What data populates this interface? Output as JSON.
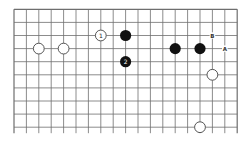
{
  "diagram": {
    "type": "go-board-fragment",
    "columns": 19,
    "rows": 10,
    "open_bottom": true,
    "colors": {
      "background": "#ffffff",
      "grid": "#6e6e6e",
      "black_stone": "#111111",
      "white_stone_fill": "#ffffff",
      "white_stone_stroke": "#555555",
      "label": "#333333"
    },
    "stones": [
      {
        "color": "white",
        "col": 2,
        "row": 3,
        "label": ""
      },
      {
        "color": "white",
        "col": 4,
        "row": 3,
        "label": ""
      },
      {
        "color": "white",
        "col": 7,
        "row": 2,
        "label": "1"
      },
      {
        "color": "black",
        "col": 9,
        "row": 2,
        "label": ""
      },
      {
        "color": "black",
        "col": 9,
        "row": 4,
        "label": "2"
      },
      {
        "color": "black",
        "col": 13,
        "row": 3,
        "label": ""
      },
      {
        "color": "black",
        "col": 15,
        "row": 3,
        "label": ""
      },
      {
        "color": "white",
        "col": 16,
        "row": 5,
        "label": ""
      },
      {
        "color": "white",
        "col": 15,
        "row": 9,
        "label": ""
      }
    ],
    "point_labels": [
      {
        "col": 16,
        "row": 2,
        "text": "B"
      },
      {
        "col": 17,
        "row": 3,
        "text": "A"
      }
    ]
  }
}
